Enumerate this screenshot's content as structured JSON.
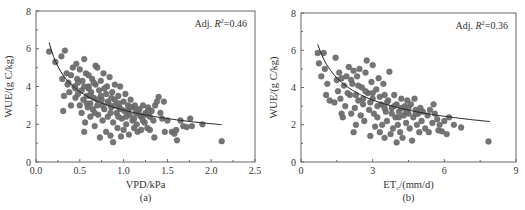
{
  "chart_data": [
    {
      "id": "a",
      "type": "scatter",
      "panel_label": "(a)",
      "xlabel": "VPD/kPa",
      "ylabel": "WUE/(g C/kg)",
      "annotation": {
        "prefix": "Adj. ",
        "r": "R",
        "sup": "2",
        "value": "=0.46"
      },
      "xlim": [
        0,
        2.5
      ],
      "ylim": [
        0,
        8
      ],
      "xticks": [
        0,
        0.5,
        1.0,
        1.5,
        2.0,
        2.5
      ],
      "xtick_labels": [
        "0.0",
        "0.5",
        "1.0",
        "1.5",
        "2.0",
        "2.5"
      ],
      "xminor": [
        0.25,
        0.75,
        1.25,
        1.75,
        2.25
      ],
      "yticks": [
        0,
        2,
        4,
        6,
        8
      ],
      "ytick_labels": [
        "0",
        "2",
        "4",
        "6",
        "8"
      ],
      "yminor": [
        1,
        3,
        5,
        7
      ],
      "grid": false,
      "fit_curve": {
        "type": "power",
        "a": 2.75,
        "b": -0.44,
        "x_range": [
          0.15,
          2.12
        ]
      },
      "points": [
        [
          0.15,
          5.85
        ],
        [
          0.22,
          5.3
        ],
        [
          0.29,
          5.6
        ],
        [
          0.33,
          5.9
        ],
        [
          0.3,
          4.4
        ],
        [
          0.32,
          3.5
        ],
        [
          0.31,
          2.7
        ],
        [
          0.35,
          4.7
        ],
        [
          0.37,
          4.2
        ],
        [
          0.38,
          3.7
        ],
        [
          0.4,
          3.0
        ],
        [
          0.4,
          4.6
        ],
        [
          0.42,
          5.0
        ],
        [
          0.44,
          4.0
        ],
        [
          0.45,
          3.4
        ],
        [
          0.46,
          5.2
        ],
        [
          0.47,
          4.4
        ],
        [
          0.48,
          3.6
        ],
        [
          0.5,
          3.0
        ],
        [
          0.5,
          4.9
        ],
        [
          0.52,
          3.8
        ],
        [
          0.52,
          2.6
        ],
        [
          0.53,
          4.3
        ],
        [
          0.54,
          3.3
        ],
        [
          0.55,
          5.45
        ],
        [
          0.55,
          1.6
        ],
        [
          0.56,
          2.1
        ],
        [
          0.57,
          4.7
        ],
        [
          0.58,
          3.5
        ],
        [
          0.59,
          2.9
        ],
        [
          0.6,
          4.0
        ],
        [
          0.6,
          4.6
        ],
        [
          0.62,
          3.1
        ],
        [
          0.62,
          2.4
        ],
        [
          0.63,
          3.7
        ],
        [
          0.64,
          4.4
        ],
        [
          0.65,
          2.8
        ],
        [
          0.66,
          3.4
        ],
        [
          0.67,
          1.9
        ],
        [
          0.68,
          5.1
        ],
        [
          0.68,
          4.1
        ],
        [
          0.7,
          3.0
        ],
        [
          0.7,
          5.0
        ],
        [
          0.71,
          2.5
        ],
        [
          0.72,
          3.8
        ],
        [
          0.73,
          1.3
        ],
        [
          0.74,
          4.3
        ],
        [
          0.75,
          3.3
        ],
        [
          0.76,
          2.2
        ],
        [
          0.77,
          4.7
        ],
        [
          0.78,
          2.8
        ],
        [
          0.8,
          3.6
        ],
        [
          0.8,
          1.6
        ],
        [
          0.81,
          4.0
        ],
        [
          0.82,
          2.4
        ],
        [
          0.83,
          3.1
        ],
        [
          0.84,
          4.5
        ],
        [
          0.85,
          1.4
        ],
        [
          0.86,
          2.9
        ],
        [
          0.87,
          3.7
        ],
        [
          0.88,
          2.1
        ],
        [
          0.88,
          1.05
        ],
        [
          0.9,
          3.3
        ],
        [
          0.9,
          4.1
        ],
        [
          0.92,
          2.6
        ],
        [
          0.93,
          1.8
        ],
        [
          0.94,
          3.5
        ],
        [
          0.95,
          2.9
        ],
        [
          0.96,
          4.0
        ],
        [
          0.97,
          1.35
        ],
        [
          0.98,
          2.3
        ],
        [
          1.0,
          3.2
        ],
        [
          1.0,
          1.7
        ],
        [
          1.01,
          2.7
        ],
        [
          1.02,
          3.6
        ],
        [
          1.03,
          2.0
        ],
        [
          1.05,
          3.0
        ],
        [
          1.06,
          1.45
        ],
        [
          1.07,
          2.5
        ],
        [
          1.08,
          3.3
        ],
        [
          1.1,
          2.2
        ],
        [
          1.1,
          2.9
        ],
        [
          1.12,
          1.8
        ],
        [
          1.13,
          3.0
        ],
        [
          1.14,
          2.6
        ],
        [
          1.15,
          2.0
        ],
        [
          1.16,
          1.6
        ],
        [
          1.18,
          2.8
        ],
        [
          1.2,
          2.4
        ],
        [
          1.2,
          1.7
        ],
        [
          1.22,
          3.0
        ],
        [
          1.24,
          2.1
        ],
        [
          1.25,
          2.6
        ],
        [
          1.27,
          1.8
        ],
        [
          1.28,
          2.9
        ],
        [
          1.3,
          2.4
        ],
        [
          1.3,
          1.7
        ],
        [
          1.32,
          2.7
        ],
        [
          1.34,
          2.2
        ],
        [
          1.35,
          1.3
        ],
        [
          1.36,
          3.0
        ],
        [
          1.38,
          3.2
        ],
        [
          1.4,
          3.45
        ],
        [
          1.42,
          2.6
        ],
        [
          1.44,
          2.3
        ],
        [
          1.46,
          3.2
        ],
        [
          1.47,
          1.6
        ],
        [
          1.5,
          2.2
        ],
        [
          1.55,
          1.6
        ],
        [
          1.58,
          1.5
        ],
        [
          1.6,
          1.7
        ],
        [
          1.61,
          1.15
        ],
        [
          1.65,
          2.2
        ],
        [
          1.68,
          1.9
        ],
        [
          1.72,
          1.85
        ],
        [
          1.76,
          2.3
        ],
        [
          1.78,
          1.9
        ],
        [
          1.9,
          2.0
        ],
        [
          2.12,
          1.1
        ],
        [
          0.6,
          3.9
        ],
        [
          0.66,
          4.2
        ],
        [
          0.74,
          3.5
        ],
        [
          0.82,
          3.2
        ],
        [
          0.9,
          3.0
        ],
        [
          0.97,
          2.8
        ],
        [
          1.05,
          2.7
        ],
        [
          1.15,
          2.75
        ],
        [
          1.25,
          2.5
        ],
        [
          0.45,
          3.9
        ],
        [
          0.55,
          4.0
        ],
        [
          0.62,
          3.5
        ],
        [
          0.7,
          3.3
        ],
        [
          0.78,
          3.9
        ],
        [
          0.86,
          3.4
        ],
        [
          0.95,
          3.1
        ],
        [
          1.08,
          2.9
        ],
        [
          1.18,
          2.5
        ],
        [
          1.28,
          2.7
        ],
        [
          0.36,
          4.1
        ],
        [
          0.48,
          4.2
        ],
        [
          0.58,
          3.1
        ],
        [
          0.67,
          2.6
        ],
        [
          0.76,
          3.0
        ],
        [
          0.85,
          2.6
        ],
        [
          0.94,
          2.4
        ],
        [
          1.03,
          2.4
        ],
        [
          1.12,
          2.3
        ],
        [
          1.22,
          2.2
        ]
      ]
    },
    {
      "id": "b",
      "type": "scatter",
      "panel_label": "(b)",
      "xlabel_main": "ET",
      "xlabel_sub": "c",
      "xlabel_rest": "/(mm/d)",
      "ylabel": "WUE/(g C/kg)",
      "annotation": {
        "prefix": "Adj. ",
        "r": "R",
        "sup": "2",
        "value": "=0.36"
      },
      "xlim": [
        0,
        9
      ],
      "ylim": [
        0,
        8
      ],
      "xticks": [
        0,
        3,
        6,
        9
      ],
      "xtick_labels": [
        "0",
        "3",
        "6",
        "9"
      ],
      "xminor": [
        1.5,
        4.5,
        7.5
      ],
      "yticks": [
        0,
        2,
        4,
        6,
        8
      ],
      "ytick_labels": [
        "0",
        "2",
        "4",
        "6",
        "8"
      ],
      "yminor": [
        1,
        3,
        5,
        7
      ],
      "grid": false,
      "fit_curve": {
        "type": "power",
        "a": 5.4,
        "b": -0.44,
        "x_range": [
          0.7,
          7.9
        ]
      },
      "points": [
        [
          0.7,
          5.85
        ],
        [
          0.95,
          5.85
        ],
        [
          0.75,
          5.3
        ],
        [
          1.0,
          5.0
        ],
        [
          0.85,
          4.6
        ],
        [
          1.1,
          4.2
        ],
        [
          1.05,
          3.6
        ],
        [
          1.2,
          3.3
        ],
        [
          1.4,
          3.2
        ],
        [
          1.45,
          5.6
        ],
        [
          1.5,
          4.4
        ],
        [
          1.55,
          3.8
        ],
        [
          1.6,
          4.8
        ],
        [
          1.65,
          3.4
        ],
        [
          1.7,
          2.6
        ],
        [
          1.75,
          2.4
        ],
        [
          1.8,
          4.1
        ],
        [
          1.85,
          3.0
        ],
        [
          1.9,
          4.6
        ],
        [
          2.0,
          5.1
        ],
        [
          2.05,
          3.6
        ],
        [
          2.1,
          2.6
        ],
        [
          2.15,
          4.2
        ],
        [
          2.2,
          4.9
        ],
        [
          2.2,
          1.6
        ],
        [
          2.25,
          2.9
        ],
        [
          2.3,
          2.0
        ],
        [
          2.35,
          4.6
        ],
        [
          2.4,
          3.3
        ],
        [
          2.45,
          5.0
        ],
        [
          2.5,
          2.5
        ],
        [
          2.55,
          4.0
        ],
        [
          2.6,
          3.1
        ],
        [
          2.65,
          2.2
        ],
        [
          2.7,
          4.8
        ],
        [
          2.75,
          5.45
        ],
        [
          2.8,
          3.7
        ],
        [
          2.85,
          2.8
        ],
        [
          2.9,
          1.4
        ],
        [
          2.95,
          4.3
        ],
        [
          3.0,
          5.2
        ],
        [
          3.0,
          3.4
        ],
        [
          3.05,
          2.6
        ],
        [
          3.1,
          1.9
        ],
        [
          3.15,
          3.9
        ],
        [
          3.2,
          2.4
        ],
        [
          3.25,
          4.5
        ],
        [
          3.3,
          1.6
        ],
        [
          3.35,
          3.1
        ],
        [
          3.4,
          2.0
        ],
        [
          3.45,
          4.2
        ],
        [
          3.5,
          1.3
        ],
        [
          3.5,
          3.6
        ],
        [
          3.55,
          2.7
        ],
        [
          3.6,
          2.2
        ],
        [
          3.65,
          3.3
        ],
        [
          3.7,
          4.85
        ],
        [
          3.75,
          1.5
        ],
        [
          3.8,
          2.9
        ],
        [
          3.85,
          1.8
        ],
        [
          3.9,
          3.6
        ],
        [
          3.95,
          2.4
        ],
        [
          4.0,
          1.05
        ],
        [
          4.0,
          3.1
        ],
        [
          4.05,
          2.0
        ],
        [
          4.1,
          2.7
        ],
        [
          4.15,
          1.6
        ],
        [
          4.2,
          3.4
        ],
        [
          4.25,
          1.3
        ],
        [
          4.3,
          2.5
        ],
        [
          4.35,
          3.0
        ],
        [
          4.4,
          2.1
        ],
        [
          4.45,
          3.3
        ],
        [
          4.5,
          2.6
        ],
        [
          4.55,
          1.8
        ],
        [
          4.6,
          3.1
        ],
        [
          4.65,
          1.15
        ],
        [
          4.7,
          2.4
        ],
        [
          4.75,
          3.4
        ],
        [
          4.8,
          2.8
        ],
        [
          4.85,
          2.0
        ],
        [
          4.9,
          2.6
        ],
        [
          4.95,
          1.6
        ],
        [
          5.0,
          2.9
        ],
        [
          5.05,
          2.2
        ],
        [
          5.1,
          2.7
        ],
        [
          5.2,
          1.8
        ],
        [
          5.3,
          2.5
        ],
        [
          5.35,
          1.6
        ],
        [
          5.4,
          2.8
        ],
        [
          5.5,
          2.1
        ],
        [
          5.55,
          3.1
        ],
        [
          5.6,
          2.6
        ],
        [
          5.7,
          2.3
        ],
        [
          5.75,
          1.7
        ],
        [
          5.8,
          2.0
        ],
        [
          5.9,
          1.65
        ],
        [
          6.0,
          2.2
        ],
        [
          6.1,
          1.5
        ],
        [
          6.2,
          2.4
        ],
        [
          6.4,
          2.0
        ],
        [
          6.7,
          1.85
        ],
        [
          7.85,
          1.1
        ],
        [
          2.1,
          4.4
        ],
        [
          2.4,
          4.1
        ],
        [
          2.7,
          3.8
        ],
        [
          3.0,
          3.7
        ],
        [
          3.3,
          3.5
        ],
        [
          3.6,
          3.2
        ],
        [
          3.9,
          3.0
        ],
        [
          4.2,
          2.9
        ],
        [
          4.5,
          2.9
        ],
        [
          4.8,
          2.6
        ],
        [
          1.7,
          4.5
        ],
        [
          1.95,
          3.7
        ],
        [
          2.3,
          3.6
        ],
        [
          2.6,
          3.4
        ],
        [
          2.9,
          3.2
        ],
        [
          3.2,
          3.0
        ],
        [
          3.5,
          2.9
        ],
        [
          3.8,
          2.6
        ],
        [
          4.1,
          2.4
        ],
        [
          4.4,
          2.7
        ]
      ]
    }
  ]
}
